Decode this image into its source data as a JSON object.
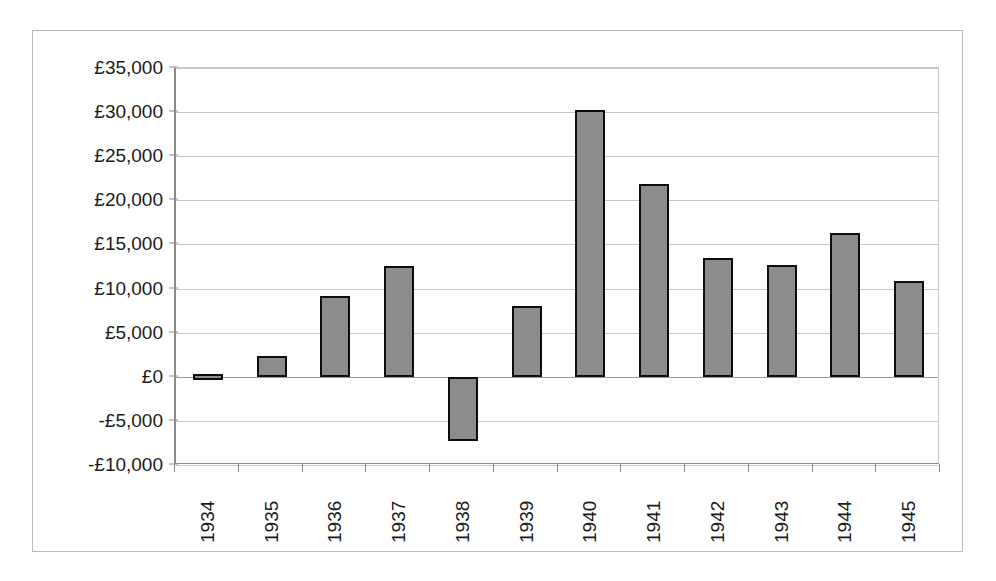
{
  "chart_data": {
    "type": "bar",
    "title": "",
    "xlabel": "",
    "ylabel": "",
    "categories": [
      "1934",
      "1935",
      "1936",
      "1937",
      "1938",
      "1939",
      "1940",
      "1941",
      "1942",
      "1943",
      "1944",
      "1945"
    ],
    "values": [
      300,
      2300,
      9100,
      12600,
      -7300,
      8000,
      30200,
      21800,
      13500,
      12700,
      16300,
      10800
    ],
    "ylim": [
      -10000,
      35000
    ],
    "ytick_values": [
      35000,
      30000,
      25000,
      20000,
      15000,
      10000,
      5000,
      0,
      -5000,
      -10000
    ],
    "ytick_labels": [
      "£35,000",
      "£30,000",
      "£25,000",
      "£20,000",
      "£15,000",
      "£10,000",
      "£5,000",
      "£0",
      "-£5,000",
      "-£10,000"
    ],
    "currency_symbol": "£",
    "grid": true,
    "legend": false,
    "bar_fill_color": "#8c8c8c",
    "bar_border_color": "#0d0d0d",
    "gridline_color": "#c6c6c6",
    "axis_color": "#8a8a8a",
    "background_color": "#ffffff"
  }
}
